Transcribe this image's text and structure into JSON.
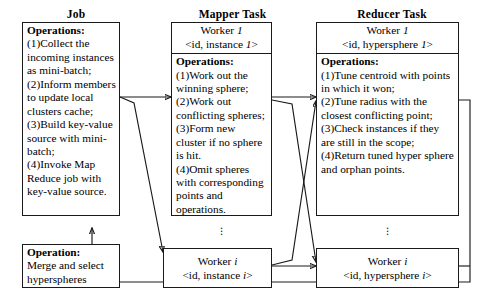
{
  "columns": [
    {
      "header": "Job"
    },
    {
      "header": "Mapper Task"
    },
    {
      "header": "Reducer Task"
    }
  ],
  "job": {
    "operations_label": "Operations:",
    "operations": [
      "(1)Collect the incoming instances as mini-batch;",
      "(2)Inform members to update local clusters cache;",
      "(3)Build key-value source with mini-batch;",
      "(4)Invoke Map Reduce job with key-value source."
    ],
    "merge_box": {
      "label": "Operation:",
      "text": "Merge and select hyperspheres"
    }
  },
  "mapper": {
    "worker_first": {
      "name": "Worker",
      "index": "1",
      "key_prefix": "<id, instance",
      "key_suffix": ">"
    },
    "operations_label": "Operations:",
    "operations": [
      "(1)Work out the winning sphere;",
      "(2)Work out conflicting spheres;",
      "(3)Form new cluster if no sphere is hit.",
      "(4)Omit spheres with corresponding points and operations."
    ],
    "worker_last": {
      "name": "Worker",
      "index": "i",
      "key_prefix": "<id, instance",
      "key_suffix": ">"
    },
    "ellipsis": "⋮"
  },
  "reducer": {
    "worker_first": {
      "name": "Worker",
      "index": "1",
      "key_prefix": "<id, hypersphere",
      "key_suffix": ">"
    },
    "operations_label": "Operations:",
    "operations": [
      "(1)Tune centroid with points in which it won;",
      "(2)Tune radius with the closest conflicting point;",
      "(3)Check instances if they are still in the scope;",
      "(4)Return tuned hyper sphere and orphan points."
    ],
    "worker_last": {
      "name": "Worker",
      "index": "i",
      "key_prefix": "<id, hypersphere",
      "key_suffix": ">"
    },
    "ellipsis": "⋮"
  },
  "colors": {
    "stroke": "#1a1a1a",
    "background": "#ffffff"
  }
}
